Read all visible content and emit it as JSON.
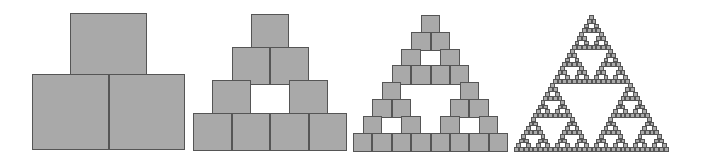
{
  "diagram": {
    "title": "",
    "colors": {
      "background": "#ffffff",
      "square_fill": "#a9a9a9",
      "square_border": "#555555"
    },
    "figures": [
      {
        "name": "iteration-1",
        "level": 1,
        "left": 32,
        "top": 13,
        "width": 153,
        "bottom": 150
      },
      {
        "name": "iteration-2",
        "level": 2,
        "left": 193,
        "top": 14,
        "width": 154,
        "bottom": 151
      },
      {
        "name": "iteration-3",
        "level": 3,
        "left": 353,
        "top": 15,
        "width": 155,
        "bottom": 152
      },
      {
        "name": "iteration-4",
        "level": 5,
        "left": 514,
        "top": 15,
        "width": 155,
        "bottom": 152
      }
    ]
  }
}
